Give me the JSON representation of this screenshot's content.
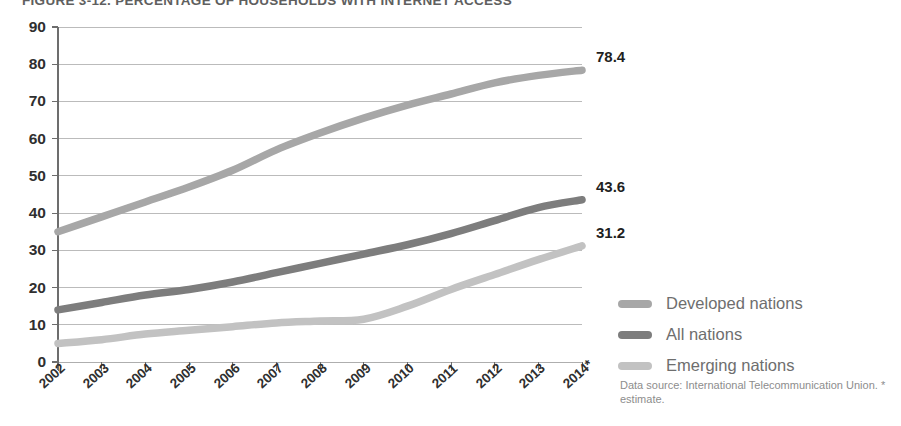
{
  "figure": {
    "title": "FIGURE 3-12. PERCENTAGE OF HOUSEHOLDS WITH INTERNET ACCESS",
    "source_note": "Data source: International Telecommunication Union. * estimate."
  },
  "legend": {
    "position": "right",
    "items": [
      {
        "label": "Developed nations",
        "color": "#a7a7a7"
      },
      {
        "label": "All nations",
        "color": "#7d7d7d"
      },
      {
        "label": "Emerging nations",
        "color": "#c2c2c2"
      }
    ]
  },
  "end_labels": [
    {
      "name": "developed-end-label",
      "value": "78.4"
    },
    {
      "name": "all-end-label",
      "value": "43.6"
    },
    {
      "name": "emerging-end-label",
      "value": "31.2"
    }
  ],
  "axes": {
    "y_ticks": [
      "90",
      "80",
      "70",
      "60",
      "50",
      "40",
      "30",
      "20",
      "10",
      "0"
    ],
    "x_ticks": [
      "2002",
      "2003",
      "2004",
      "2005",
      "2006",
      "2007",
      "2008",
      "2009",
      "2010",
      "2011",
      "2012",
      "2013",
      "2014*"
    ]
  },
  "chart_data": {
    "type": "line",
    "title": "FIGURE 3-12. PERCENTAGE OF HOUSEHOLDS WITH INTERNET ACCESS",
    "xlabel": "",
    "ylabel": "",
    "x": [
      "2002",
      "2003",
      "2004",
      "2005",
      "2006",
      "2007",
      "2008",
      "2009",
      "2010",
      "2011",
      "2012",
      "2013",
      "2014*"
    ],
    "ylim": [
      0,
      90
    ],
    "ytick_step": 10,
    "grid": true,
    "legend_position": "right",
    "series": [
      {
        "name": "Developed nations",
        "color": "#a7a7a7",
        "values": [
          35.0,
          39.0,
          43.0,
          47.0,
          51.5,
          57.0,
          61.5,
          65.5,
          69.0,
          72.0,
          75.0,
          77.0,
          78.4
        ],
        "end_label": "78.4"
      },
      {
        "name": "All nations",
        "color": "#7d7d7d",
        "values": [
          14.0,
          16.0,
          18.0,
          19.5,
          21.5,
          24.0,
          26.5,
          29.0,
          31.5,
          34.5,
          38.0,
          41.5,
          43.6
        ],
        "end_label": "43.6"
      },
      {
        "name": "Emerging nations",
        "color": "#c2c2c2",
        "values": [
          5.0,
          6.0,
          7.5,
          8.5,
          9.5,
          10.5,
          11.0,
          11.5,
          15.0,
          19.5,
          23.5,
          27.5,
          31.2
        ],
        "end_label": "31.2"
      }
    ]
  }
}
